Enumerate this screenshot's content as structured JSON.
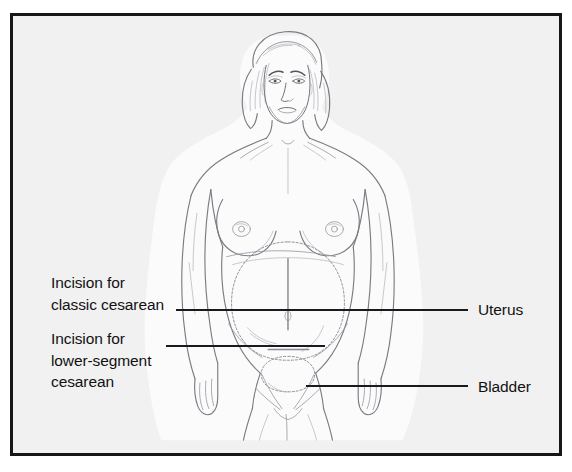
{
  "figure": {
    "background_color": "#f1f1f1",
    "frame_color": "#17171a",
    "line_color": "#1a1a1e",
    "drawing_color": "#6f6f76"
  },
  "labels": {
    "classic_cesarean": "Incision for\nclassic cesarean",
    "classic_cesarean_line1": "Incision for",
    "classic_cesarean_line2": "classic cesarean",
    "lower_segment_line1": "Incision for",
    "lower_segment_line2": "lower-segment",
    "lower_segment_line3": "cesarean",
    "uterus": "Uterus",
    "bladder": "Bladder"
  },
  "anatomy": {
    "uterus_label": "uterus-outline",
    "bladder_label": "bladder-outline",
    "classic_incision_label": "classic-vertical-incision",
    "lower_segment_incision_label": "lower-segment-horizontal-incision"
  }
}
